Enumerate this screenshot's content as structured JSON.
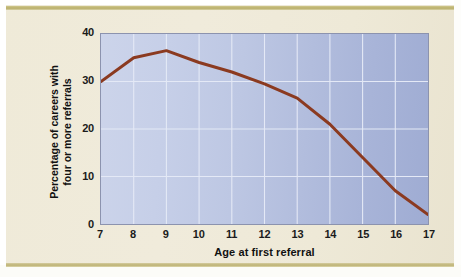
{
  "figure": {
    "background_color": "#efead8",
    "rule_color": "#b9ae69",
    "plot_border_color": "#8c93ae",
    "plot_fill_left": "#ccd4ea",
    "plot_fill_right": "#9facd3",
    "gridline_color": "#e8ecf7"
  },
  "axis": {
    "y_ticks": [
      "0",
      "10",
      "20",
      "30",
      "40"
    ],
    "x_ticks": [
      "7",
      "8",
      "9",
      "10",
      "11",
      "12",
      "13",
      "14",
      "15",
      "16",
      "17"
    ],
    "x_title": "Age at first referral",
    "y_title_line1": "Percentage of careers with",
    "y_title_line2": "four or more referrals"
  },
  "chart_data": {
    "type": "line",
    "title": "",
    "subtitle": "",
    "xlabel": "Age at first referral",
    "ylabel": "Percentage of careers with four or more referrals",
    "xlim": [
      7,
      17
    ],
    "ylim": [
      0,
      40
    ],
    "xticks": [
      7,
      8,
      9,
      10,
      11,
      12,
      13,
      14,
      15,
      16,
      17
    ],
    "yticks": [
      0,
      10,
      20,
      30,
      40
    ],
    "grid": true,
    "legend": null,
    "legend_position": "none",
    "x": [
      7,
      8,
      9,
      10,
      11,
      12,
      13,
      14,
      15,
      16,
      17
    ],
    "series": [
      {
        "name": "Percentage of careers with four or more referrals",
        "color": "#8b3a20",
        "line_width": 3,
        "values": [
          30,
          35,
          36.5,
          34,
          32,
          29.5,
          26.5,
          21,
          14,
          7,
          2
        ]
      }
    ]
  }
}
